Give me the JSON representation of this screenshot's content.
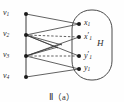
{
  "figure": {
    "caption": "Ⅱ（a）",
    "region_label": "H"
  },
  "left_vertices": [
    {
      "id": "v1",
      "base": "v",
      "sub": "1",
      "x": 26,
      "y": 14,
      "label_x": 3,
      "label_y": 9
    },
    {
      "id": "v2",
      "base": "v",
      "sub": "2",
      "x": 26,
      "y": 35,
      "label_x": 3,
      "label_y": 30
    },
    {
      "id": "v3",
      "base": "v",
      "sub": "3",
      "x": 26,
      "y": 56,
      "label_x": 3,
      "label_y": 51
    },
    {
      "id": "v4",
      "base": "v",
      "sub": "4",
      "x": 26,
      "y": 77,
      "label_x": 3,
      "label_y": 72
    }
  ],
  "right_vertices": [
    {
      "id": "x1",
      "base": "x",
      "prime": "",
      "sub": "1",
      "x": 79,
      "y": 24,
      "label_x": 84,
      "label_y": 19
    },
    {
      "id": "x1p",
      "base": "x",
      "prime": "′",
      "sub": "1",
      "x": 79,
      "y": 37,
      "label_x": 84,
      "label_y": 32
    },
    {
      "id": "y1p",
      "base": "y",
      "prime": "′",
      "sub": "1",
      "x": 79,
      "y": 56,
      "label_x": 84,
      "label_y": 51
    },
    {
      "id": "y1",
      "base": "y",
      "prime": "",
      "sub": "1",
      "x": 79,
      "y": 69,
      "label_x": 84,
      "label_y": 64
    }
  ],
  "edges_solid": [
    {
      "name": "edge-v1-x1",
      "x1": 26,
      "y1": 14,
      "x2": 79,
      "y2": 24
    },
    {
      "name": "edge-v2-x1",
      "x1": 26,
      "y1": 35,
      "x2": 79,
      "y2": 24
    },
    {
      "name": "edge-v2-y1p",
      "x1": 26,
      "y1": 35,
      "x2": 79,
      "y2": 56
    },
    {
      "name": "edge-v3-x1p",
      "x1": 26,
      "y1": 56,
      "x2": 79,
      "y2": 37
    },
    {
      "name": "edge-v3-y1",
      "x1": 26,
      "y1": 56,
      "x2": 79,
      "y2": 69
    },
    {
      "name": "edge-v4-y1",
      "x1": 26,
      "y1": 77,
      "x2": 79,
      "y2": 69
    },
    {
      "name": "edge-v2-stub-a",
      "x1": 26,
      "y1": 35,
      "x2": 62,
      "y2": 45
    },
    {
      "name": "edge-v2-stub-b",
      "x1": 26,
      "y1": 35,
      "x2": 58,
      "y2": 48
    },
    {
      "name": "edge-v3-stub-a",
      "x1": 26,
      "y1": 56,
      "x2": 62,
      "y2": 44
    },
    {
      "name": "edge-v3-stub-b",
      "x1": 26,
      "y1": 56,
      "x2": 58,
      "y2": 47
    }
  ],
  "edges_dashed": [
    {
      "name": "edge-v2-x1p-dashed",
      "x1": 26,
      "y1": 35,
      "x2": 79,
      "y2": 37
    },
    {
      "name": "edge-v3-y1p-dashed",
      "x1": 26,
      "y1": 56,
      "x2": 79,
      "y2": 56
    }
  ],
  "left_spine": {
    "x1": 26,
    "y1": 14,
    "x2": 26,
    "y2": 77
  },
  "oval": {
    "x": 72,
    "y": 10,
    "width": 40,
    "height": 70,
    "rx": 19
  },
  "region_label_pos": {
    "x": 97,
    "y": 39
  },
  "colors": {
    "stroke": "#3a3a3a",
    "vertex": "#1a1a1a",
    "oval": "#4a4a4a",
    "background": "#fefefe",
    "text": "#2b2b2b"
  }
}
